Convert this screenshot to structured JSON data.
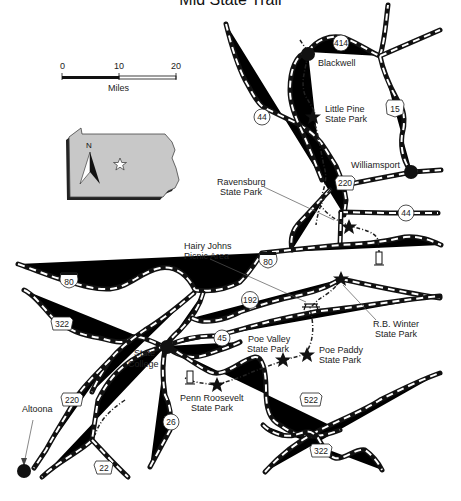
{
  "title": "Mid State Trail",
  "scale_bar": {
    "ticks": [
      "0",
      "10",
      "20"
    ],
    "unit": "Miles"
  },
  "inset": {
    "state": "Pennsylvania",
    "north_label": "N",
    "marker": "star-icon",
    "fill": "#c8c8c8"
  },
  "cities": [
    {
      "name": "Blackwell"
    },
    {
      "name": "Williamsport"
    },
    {
      "name": "State College"
    },
    {
      "name": "Altoona"
    }
  ],
  "parks": [
    {
      "name": "Little Pine State Park",
      "line1": "Little Pine",
      "line2": "State Park"
    },
    {
      "name": "Ravensburg State Park",
      "line1": "Ravensburg",
      "line2": "State Park"
    },
    {
      "name": "Hairy Johns Picnic Area",
      "line1": "Hairy Johns",
      "line2": "Picnic Area"
    },
    {
      "name": "R.B. Winter State Park",
      "line1": "R.B. Winter",
      "line2": "State Park"
    },
    {
      "name": "Poe Valley State Park",
      "line1": "Poe Valley",
      "line2": "State Park"
    },
    {
      "name": "Poe Paddy State Park",
      "line1": "Poe Paddy",
      "line2": "State Park"
    },
    {
      "name": "Penn Roosevelt State Park",
      "line1": "Penn Roosevelt",
      "line2": "State Park"
    }
  ],
  "routes": {
    "r414": "414",
    "r44a": "44",
    "r15": "15",
    "r220a": "220",
    "r44b": "44",
    "r80a": "80",
    "r80b": "80",
    "r192": "192",
    "r322a": "322",
    "r45": "45",
    "r220b": "220",
    "r26": "26",
    "r22": "22",
    "r522": "522",
    "r322b": "322"
  },
  "colors": {
    "road": "#111111",
    "trail": "#222222",
    "inset_fill": "#c8c8c8",
    "inset_shadow": "#222222"
  }
}
